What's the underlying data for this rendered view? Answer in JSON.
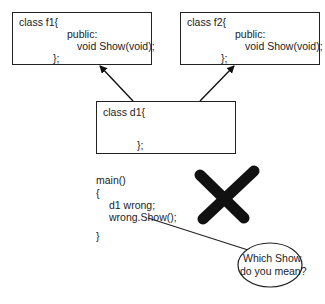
{
  "classes": {
    "f1": {
      "header": "class f1{",
      "access": "public:",
      "method": "void Show(void);",
      "close": "};"
    },
    "f2": {
      "header": "class f2{",
      "access": "public:",
      "method": "void Show(void);",
      "close": "};"
    },
    "d1": {
      "header": "class d1{",
      "close": "};"
    }
  },
  "main_code": {
    "lines": [
      "main()",
      "{",
      "d1 wrong;",
      "wrong.Show();",
      "}"
    ]
  },
  "speech_bubble": {
    "line1": "Which Show",
    "line2": "do you mean?"
  },
  "marks": {
    "error_mark": "X",
    "error_color": "#111111"
  },
  "relations": [
    {
      "from": "d1",
      "to": "f1",
      "type": "inheritance-arrow"
    },
    {
      "from": "d1",
      "to": "f2",
      "type": "inheritance-arrow"
    }
  ]
}
